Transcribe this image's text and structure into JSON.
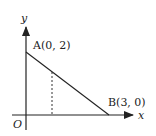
{
  "diagram": {
    "axes": {
      "x_label": "x",
      "y_label": "y",
      "origin_label": "O"
    },
    "points": [
      {
        "name": "A",
        "label": "A(0, 2)",
        "x": 0,
        "y": 2
      },
      {
        "name": "B",
        "label": "B(3, 0)",
        "x": 3,
        "y": 0
      }
    ],
    "segments": [
      {
        "from": "A",
        "to": "B",
        "style": "solid"
      },
      {
        "description": "vertical dashed line from segment AB down to x-axis",
        "style": "dashed"
      }
    ],
    "colors": {
      "line": "#222222",
      "background": "#ffffff"
    }
  }
}
